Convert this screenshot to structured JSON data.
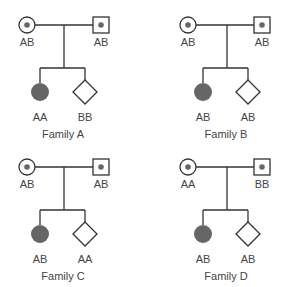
{
  "colors": {
    "line": "#333333",
    "affected_fill": "#666666",
    "carrier_dot": "#666666",
    "text": "#444444"
  },
  "legend": {
    "symbols": {
      "circle": "female",
      "square": "male",
      "diamond": "sex unspecified",
      "filled": "affected",
      "dot": "carrier"
    }
  },
  "families": [
    {
      "name": "Family A",
      "mother": {
        "symbol": "circle-dot",
        "genotype": "AB"
      },
      "father": {
        "symbol": "square-dot",
        "genotype": "AB"
      },
      "children": [
        {
          "symbol": "circle-filled",
          "genotype": "AA"
        },
        {
          "symbol": "diamond",
          "genotype": "BB"
        }
      ]
    },
    {
      "name": "Family B",
      "mother": {
        "symbol": "circle-dot",
        "genotype": "AB"
      },
      "father": {
        "symbol": "square-dot",
        "genotype": "AB"
      },
      "children": [
        {
          "symbol": "circle-filled",
          "genotype": "AB"
        },
        {
          "symbol": "diamond",
          "genotype": "AB"
        }
      ]
    },
    {
      "name": "Family C",
      "mother": {
        "symbol": "circle-dot",
        "genotype": "AB"
      },
      "father": {
        "symbol": "square-dot",
        "genotype": "AB"
      },
      "children": [
        {
          "symbol": "circle-filled",
          "genotype": "AB"
        },
        {
          "symbol": "diamond",
          "genotype": "AA"
        }
      ]
    },
    {
      "name": "Family D",
      "mother": {
        "symbol": "circle-dot",
        "genotype": "AA"
      },
      "father": {
        "symbol": "square-dot",
        "genotype": "BB"
      },
      "children": [
        {
          "symbol": "circle-filled",
          "genotype": "AB"
        },
        {
          "symbol": "diamond",
          "genotype": "AB"
        }
      ]
    }
  ]
}
